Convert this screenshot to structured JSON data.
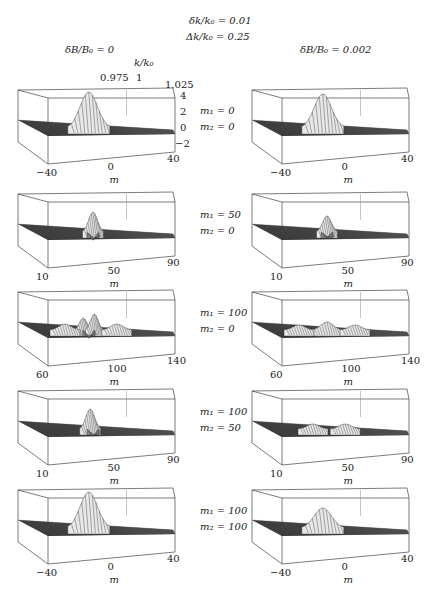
{
  "chart_data": {
    "type": "surface3d",
    "title_lines": [
      "δk/k₀ = 0.01",
      "Δk/k₀ = 0.25"
    ],
    "column_titles": [
      "δB/B₀ = 0",
      "δB/B₀ = 0.002"
    ],
    "y_axis_label": "k/k₀",
    "y_ticks": [
      "0.975",
      "1",
      "1.025"
    ],
    "z_ticks": [
      "4",
      "2",
      "0",
      "−2"
    ],
    "xlabel": "m",
    "rows": [
      {
        "m1_label": "m₁ = 0",
        "m2_label": "m₂ = 0",
        "x_ticks": [
          "−40",
          "0",
          "40"
        ],
        "left": {
          "peaks": [
            {
              "pos": 0.42,
              "h": 36,
              "w": 0.07
            }
          ]
        },
        "right": {
          "peaks": [
            {
              "pos": 0.42,
              "h": 34,
              "w": 0.07
            }
          ]
        }
      },
      {
        "m1_label": "m₁ = 50",
        "m2_label": "m₂ = 0",
        "x_ticks": [
          "10",
          "50",
          "90"
        ],
        "left": {
          "peaks": [
            {
              "pos": 0.45,
              "h": 20,
              "w": 0.035
            },
            {
              "pos": 0.45,
              "h": -8,
              "w": 0.02
            }
          ]
        },
        "right": {
          "peaks": [
            {
              "pos": 0.45,
              "h": 16,
              "w": 0.035
            },
            {
              "pos": 0.45,
              "h": -5,
              "w": 0.02
            }
          ]
        }
      },
      {
        "m1_label": "m₁ = 100",
        "m2_label": "m₂ = 0",
        "x_ticks": [
          "60",
          "100",
          "140"
        ],
        "left": {
          "peaks": [
            {
              "pos": 0.38,
              "h": 12,
              "w": 0.03
            },
            {
              "pos": 0.46,
              "h": 16,
              "w": 0.03
            },
            {
              "pos": 0.25,
              "h": 6,
              "w": 0.05
            },
            {
              "pos": 0.62,
              "h": 6,
              "w": 0.05
            },
            {
              "pos": 0.42,
              "h": -8,
              "w": 0.02
            }
          ]
        },
        "right": {
          "peaks": [
            {
              "pos": 0.45,
              "h": 8,
              "w": 0.05
            },
            {
              "pos": 0.25,
              "h": 5,
              "w": 0.05
            },
            {
              "pos": 0.65,
              "h": 5,
              "w": 0.05
            }
          ]
        }
      },
      {
        "m1_label": "m₁ = 100",
        "m2_label": "m₂ = 50",
        "x_ticks": [
          "10",
          "50",
          "90"
        ],
        "left": {
          "peaks": [
            {
              "pos": 0.43,
              "h": 20,
              "w": 0.035
            },
            {
              "pos": 0.45,
              "h": -7,
              "w": 0.02
            }
          ]
        },
        "right": {
          "peaks": [
            {
              "pos": 0.35,
              "h": 5,
              "w": 0.05
            },
            {
              "pos": 0.58,
              "h": 5,
              "w": 0.05
            }
          ]
        }
      },
      {
        "m1_label": "m₁ = 100",
        "m2_label": "m₂ = 100",
        "x_ticks": [
          "−40",
          "0",
          "40"
        ],
        "left": {
          "peaks": [
            {
              "pos": 0.42,
              "h": 36,
              "w": 0.07
            }
          ]
        },
        "right": {
          "peaks": [
            {
              "pos": 0.42,
              "h": 20,
              "w": 0.07
            }
          ]
        }
      }
    ]
  }
}
